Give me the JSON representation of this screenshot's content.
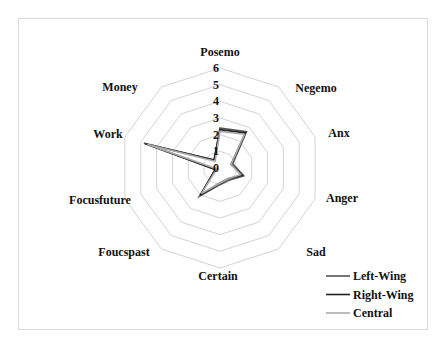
{
  "chart_data": {
    "type": "radar",
    "title": "",
    "axes": [
      "Posemo",
      "Negemo",
      "Anx",
      "Anger",
      "Sad",
      "Certain",
      "Foucspast",
      "Focusfuture",
      "Work",
      "Money"
    ],
    "rlim": [
      0,
      6
    ],
    "ticks": [
      "0",
      "1",
      "2",
      "3",
      "4",
      "5",
      "6"
    ],
    "grid": true,
    "legend_position": "bottom-right",
    "series": [
      {
        "name": "Left-Wing",
        "color": "#555555",
        "values": [
          2.4,
          2.7,
          0.8,
          1.5,
          0.9,
          1.0,
          2.1,
          0.3,
          4.8,
          0.6
        ]
      },
      {
        "name": "Right-Wing",
        "color": "#222222",
        "values": [
          2.3,
          2.6,
          0.7,
          1.4,
          0.8,
          0.9,
          2.0,
          0.3,
          4.7,
          0.6
        ]
      },
      {
        "name": "Central",
        "color": "#aaaaaa",
        "values": [
          2.2,
          2.5,
          0.7,
          1.3,
          0.8,
          0.9,
          1.9,
          0.2,
          4.6,
          0.5
        ]
      }
    ]
  },
  "legend": {
    "items": [
      {
        "label": "Left-Wing",
        "color": "#555555"
      },
      {
        "label": "Right-Wing",
        "color": "#222222"
      },
      {
        "label": "Central",
        "color": "#aaaaaa"
      }
    ]
  }
}
